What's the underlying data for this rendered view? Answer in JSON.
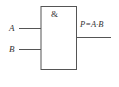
{
  "diagram": {
    "type": "logic-gate",
    "gate_symbol": "&",
    "inputs": [
      {
        "label": "A"
      },
      {
        "label": "B"
      }
    ],
    "output": {
      "label": "P=A·B"
    },
    "colors": {
      "stroke": "#555555",
      "text": "#333333",
      "background": "#ffffff"
    }
  }
}
